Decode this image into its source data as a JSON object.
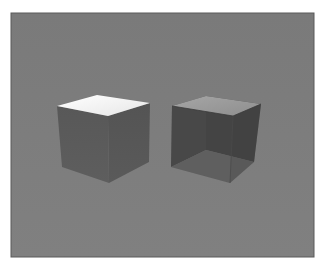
{
  "image": {
    "description": "3D render of two cubes on a gray background",
    "background_color": "#7f7f7f",
    "frame_border_color": "#5a5a5a"
  },
  "objects": [
    {
      "name": "opaque-cube",
      "top_color": "#f2f2f2",
      "left_face_color": "#5c5c5c",
      "right_face_color": "#565656"
    },
    {
      "name": "transparent-open-cube",
      "top_color": "#9a9a9a",
      "back_left_color": "#4a4a4a",
      "back_right_color": "#444444",
      "floor_color": "#6a6a6a"
    }
  ]
}
